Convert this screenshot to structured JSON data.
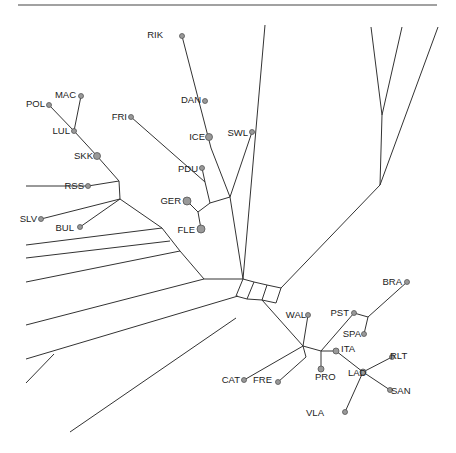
{
  "figure": {
    "type": "phylogenetic-network",
    "top_rule": [
      18,
      5,
      437,
      5
    ],
    "labels": [
      {
        "id": "RIK",
        "text": "RIK",
        "x": 163,
        "y": 38,
        "lx": "end",
        "nx": 182,
        "ny": 36,
        "r": 2.5
      },
      {
        "id": "MAC",
        "text": "MAC",
        "x": 76,
        "y": 98,
        "lx": "end",
        "nx": 81,
        "ny": 96,
        "r": 2.5
      },
      {
        "id": "POL",
        "text": "POL",
        "x": 45,
        "y": 107,
        "lx": "end",
        "nx": 49,
        "ny": 105,
        "r": 2.5
      },
      {
        "id": "DAN",
        "text": "DAN",
        "x": 201,
        "y": 103,
        "lx": "end",
        "nx": 205,
        "ny": 101,
        "r": 2.5
      },
      {
        "id": "FRI",
        "text": "FRI",
        "x": 127,
        "y": 120,
        "lx": "end",
        "nx": 131,
        "ny": 117,
        "r": 2.5
      },
      {
        "id": "LUL",
        "text": "LUL",
        "x": 70,
        "y": 134,
        "lx": "end",
        "nx": 74,
        "ny": 131,
        "r": 2.5
      },
      {
        "id": "ICE",
        "text": "ICE",
        "x": 205,
        "y": 140,
        "lx": "end",
        "nx": 209,
        "ny": 137,
        "r": 3.5
      },
      {
        "id": "SWL",
        "text": "SWL",
        "x": 248,
        "y": 136,
        "lx": "end",
        "nx": 252,
        "ny": 132,
        "r": 2.5
      },
      {
        "id": "SKK",
        "text": "SKK",
        "x": 93,
        "y": 159,
        "lx": "end",
        "nx": 97,
        "ny": 156,
        "r": 3.5
      },
      {
        "id": "PDU",
        "text": "PDU",
        "x": 198,
        "y": 172,
        "lx": "end",
        "nx": 202,
        "ny": 168,
        "r": 2.5
      },
      {
        "id": "RSS",
        "text": "RSS",
        "x": 84,
        "y": 189,
        "lx": "end",
        "nx": 88,
        "ny": 186,
        "r": 2.5
      },
      {
        "id": "GER",
        "text": "GER",
        "x": 181,
        "y": 204,
        "lx": "end",
        "nx": 187,
        "ny": 201,
        "r": 4
      },
      {
        "id": "SLV",
        "text": "SLV",
        "x": 37,
        "y": 222,
        "lx": "end",
        "nx": 41,
        "ny": 219,
        "r": 2.5
      },
      {
        "id": "BUL",
        "text": "BUL",
        "x": 74,
        "y": 231,
        "lx": "end",
        "nx": 80,
        "ny": 227,
        "r": 2.5
      },
      {
        "id": "FLE",
        "text": "FLE",
        "x": 195,
        "y": 233,
        "lx": "end",
        "nx": 201,
        "ny": 229,
        "r": 4
      },
      {
        "id": "BRA",
        "text": "BRA",
        "x": 402,
        "y": 285,
        "lx": "end",
        "nx": 407,
        "ny": 282,
        "r": 2.5
      },
      {
        "id": "PST",
        "text": "PST",
        "x": 349,
        "y": 316,
        "lx": "end",
        "nx": 354,
        "ny": 313,
        "r": 2.5
      },
      {
        "id": "WAL",
        "text": "WAL",
        "x": 306,
        "y": 318,
        "lx": "end",
        "nx": 308,
        "ny": 315,
        "r": 2.5
      },
      {
        "id": "SPA",
        "text": "SPA",
        "x": 361,
        "y": 337,
        "lx": "end",
        "nx": 364,
        "ny": 334,
        "r": 2.5
      },
      {
        "id": "ITA",
        "text": "ITA",
        "x": 341,
        "y": 352,
        "lx": "start",
        "nx": 336,
        "ny": 351,
        "r": 3
      },
      {
        "id": "RLT",
        "text": "RLT",
        "x": 390,
        "y": 359,
        "lx": "start",
        "nx": 392,
        "ny": 357,
        "r": 2.5
      },
      {
        "id": "LAD",
        "text": "LAD",
        "x": 348,
        "y": 376,
        "lx": "start",
        "nx": 363,
        "ny": 372,
        "r": 3
      },
      {
        "id": "CAT",
        "text": "CAT",
        "x": 240,
        "y": 383,
        "lx": "end",
        "nx": 244,
        "ny": 380,
        "r": 2.5
      },
      {
        "id": "FRE",
        "text": "FRE",
        "x": 272,
        "y": 383,
        "lx": "end",
        "nx": 278,
        "ny": 382,
        "r": 2.5
      },
      {
        "id": "PRO",
        "text": "PRO",
        "x": 315,
        "y": 380,
        "lx": "start",
        "nx": 321,
        "ny": 369,
        "r": 3
      },
      {
        "id": "SAN",
        "text": "SAN",
        "x": 391,
        "y": 394,
        "lx": "start",
        "nx": 390,
        "ny": 390,
        "r": 2.5
      },
      {
        "id": "VLA",
        "text": "VLA",
        "x": 324,
        "y": 416,
        "lx": "end",
        "nx": 345,
        "ny": 412,
        "r": 2.5
      }
    ],
    "edges": [
      [
        182,
        36,
        211,
        148
      ],
      [
        205,
        101,
        205,
        101
      ],
      [
        211,
        148,
        230,
        197
      ],
      [
        230,
        197,
        252,
        132
      ],
      [
        81,
        96,
        74,
        131
      ],
      [
        49,
        105,
        74,
        131
      ],
      [
        74,
        131,
        97,
        156
      ],
      [
        97,
        156,
        119,
        181
      ],
      [
        88,
        186,
        119,
        181
      ],
      [
        26,
        186,
        60,
        186
      ],
      [
        60,
        186,
        88,
        186
      ],
      [
        119,
        181,
        120,
        199
      ],
      [
        120,
        199,
        41,
        219
      ],
      [
        120,
        199,
        80,
        227
      ],
      [
        131,
        117,
        205,
        182
      ],
      [
        202,
        168,
        205,
        182
      ],
      [
        205,
        182,
        210,
        203
      ],
      [
        187,
        201,
        198,
        212
      ],
      [
        198,
        212,
        210,
        203
      ],
      [
        198,
        212,
        201,
        229
      ],
      [
        210,
        203,
        230,
        197
      ],
      [
        230,
        197,
        243,
        279
      ],
      [
        120,
        199,
        162,
        228
      ],
      [
        162,
        228,
        180,
        251
      ],
      [
        180,
        251,
        204,
        279
      ],
      [
        204,
        279,
        243,
        279
      ],
      [
        26,
        245,
        162,
        228
      ],
      [
        26,
        258,
        170,
        241
      ],
      [
        26,
        282,
        180,
        251
      ],
      [
        26,
        325,
        204,
        279
      ],
      [
        26,
        359,
        238,
        296
      ],
      [
        54,
        354,
        26,
        383
      ],
      [
        70,
        432,
        236,
        318
      ],
      [
        243,
        279,
        236,
        296
      ],
      [
        243,
        279,
        254,
        282
      ],
      [
        254,
        282,
        247,
        299
      ],
      [
        236,
        296,
        247,
        299
      ],
      [
        254,
        282,
        267,
        285
      ],
      [
        267,
        285,
        262,
        300
      ],
      [
        247,
        299,
        262,
        300
      ],
      [
        267,
        285,
        281,
        288
      ],
      [
        281,
        288,
        276,
        303
      ],
      [
        262,
        300,
        276,
        303
      ],
      [
        265,
        25,
        243,
        279
      ],
      [
        371,
        27,
        382,
        115
      ],
      [
        402,
        27,
        382,
        115
      ],
      [
        382,
        115,
        380,
        185
      ],
      [
        438,
        27,
        380,
        185
      ],
      [
        380,
        185,
        281,
        288
      ],
      [
        262,
        300,
        303,
        346
      ],
      [
        303,
        346,
        308,
        315
      ],
      [
        303,
        346,
        306,
        357
      ],
      [
        306,
        357,
        278,
        382
      ],
      [
        303,
        346,
        244,
        380
      ],
      [
        303,
        346,
        321,
        351
      ],
      [
        321,
        351,
        321,
        369
      ],
      [
        321,
        351,
        354,
        313
      ],
      [
        321,
        351,
        336,
        351
      ],
      [
        336,
        351,
        363,
        372
      ],
      [
        363,
        372,
        392,
        357
      ],
      [
        363,
        372,
        390,
        390
      ],
      [
        363,
        372,
        345,
        412
      ],
      [
        354,
        313,
        368,
        317
      ],
      [
        368,
        317,
        364,
        334
      ],
      [
        368,
        317,
        407,
        282
      ]
    ]
  }
}
